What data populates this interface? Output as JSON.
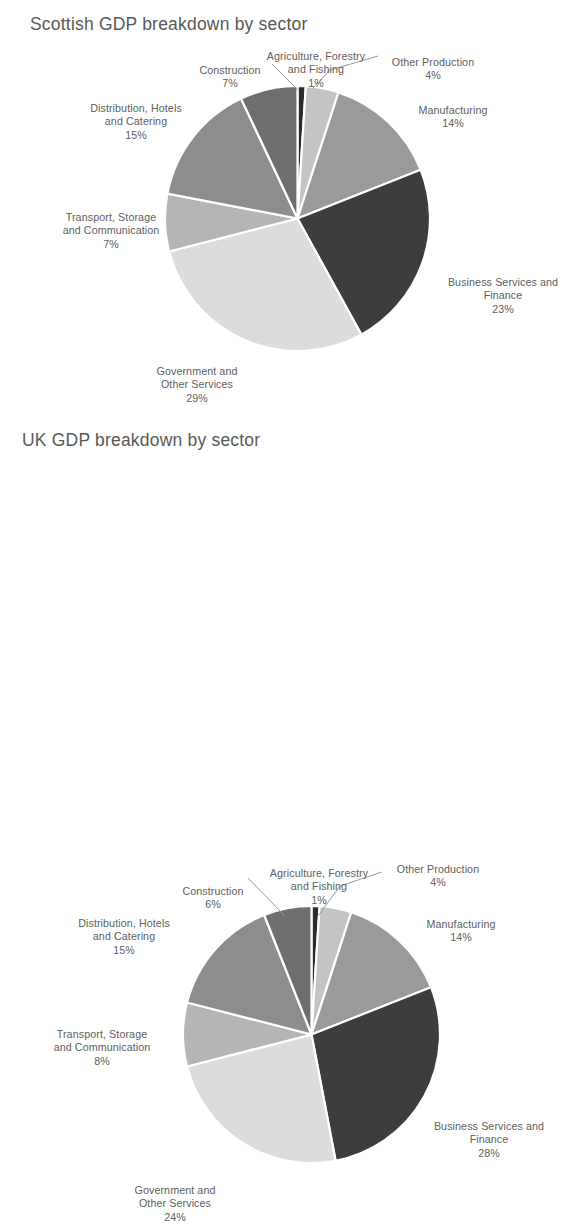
{
  "charts": [
    {
      "id": "chart-1",
      "title": "Scottish GDP breakdown by sector",
      "labels": {
        "agriculture": "Agriculture, Forestry\nand Fishing",
        "agriculture_pct": "1%",
        "other_production": "Other Production",
        "other_production_pct": "4%",
        "construction": "Construction",
        "construction_pct": "7%",
        "manufacturing": "Manufacturing",
        "manufacturing_pct": "14%",
        "distribution": "Distribution, Hotels\nand Catering",
        "distribution_pct": "15%",
        "business": "Business Services and\nFinance",
        "business_pct": "23%",
        "transport": "Transport, Storage\nand Communication",
        "transport_pct": "7%",
        "government": "Government and\nOther Services",
        "government_pct": "29%"
      }
    },
    {
      "id": "chart-2",
      "title": "UK GDP breakdown by sector",
      "labels": {
        "agriculture": "Agriculture, Forestry\nand Fishing",
        "agriculture_pct": "1%",
        "other_production": "Other Production",
        "other_production_pct": "4%",
        "construction": "Construction",
        "construction_pct": "6%",
        "manufacturing": "Manufacturing",
        "manufacturing_pct": "14%",
        "distribution": "Distribution, Hotels\nand Catering",
        "distribution_pct": "15%",
        "business": "Business Services and\nFinance",
        "business_pct": "28%",
        "transport": "Transport, Storage\nand Communication",
        "transport_pct": "8%",
        "government": "Government and\nOther Services",
        "government_pct": "24%"
      }
    }
  ],
  "chart_data": [
    {
      "type": "pie",
      "title": "Scottish GDP breakdown by sector",
      "categories": [
        "Agriculture, Forestry and Fishing",
        "Other Production",
        "Manufacturing",
        "Business Services and Finance",
        "Government and Other Services",
        "Transport, Storage and Communication",
        "Distribution, Hotels and Catering",
        "Construction"
      ],
      "values": [
        1,
        4,
        14,
        23,
        29,
        7,
        15,
        7
      ],
      "unit": "%",
      "colors": [
        "#2b2b2b",
        "#c4c4c4",
        "#9a9a9a",
        "#3d3d3d",
        "#dcdcdc",
        "#b5b5b5",
        "#8d8d8d",
        "#6e6e6e"
      ],
      "start_angle_deg": 0,
      "direction": "clockwise",
      "legend": "none",
      "labels_position": "outside-with-leader-lines",
      "grid": false
    },
    {
      "type": "pie",
      "title": "UK GDP breakdown by sector",
      "categories": [
        "Agriculture, Forestry and Fishing",
        "Other Production",
        "Manufacturing",
        "Business Services and Finance",
        "Government and Other Services",
        "Transport, Storage and Communication",
        "Distribution, Hotels and Catering",
        "Construction"
      ],
      "values": [
        1,
        4,
        14,
        28,
        24,
        8,
        15,
        6
      ],
      "unit": "%",
      "colors": [
        "#2b2b2b",
        "#c4c4c4",
        "#9a9a9a",
        "#3d3d3d",
        "#dcdcdc",
        "#b5b5b5",
        "#8d8d8d",
        "#6e6e6e"
      ],
      "start_angle_deg": 0,
      "direction": "clockwise",
      "legend": "none",
      "labels_position": "outside-with-leader-lines",
      "grid": false
    }
  ]
}
